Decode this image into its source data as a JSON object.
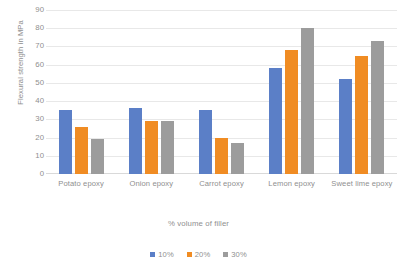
{
  "chart_data": {
    "type": "bar",
    "title": "",
    "subtitle": "",
    "xlabel": "% volume of filler",
    "ylabel": "Flexural strength in MPa",
    "categories": [
      "Potato epoxy",
      "Onion epoxy",
      "Carrot epoxy",
      "Lemon epoxy",
      "Sweet lime epoxy"
    ],
    "series": [
      {
        "name": "10%",
        "color": "#5b7fc7",
        "values": [
          35,
          36,
          35,
          58,
          52
        ]
      },
      {
        "name": "20%",
        "color": "#f08c23",
        "values": [
          26,
          29,
          20,
          68,
          65
        ]
      },
      {
        "name": "30%",
        "color": "#9c9c9c",
        "values": [
          19,
          29,
          17,
          80,
          73
        ]
      }
    ],
    "ylim": [
      0,
      90
    ],
    "ytick_step": 10,
    "yticks": [
      "90",
      "80",
      "70",
      "60",
      "50",
      "40",
      "30",
      "20",
      "10",
      "0"
    ],
    "grid": true,
    "grid_axis": "y",
    "legend_position": "bottom"
  },
  "legend": {
    "items": [
      {
        "label": "10%",
        "color": "#5b7fc7"
      },
      {
        "label": "20%",
        "color": "#f08c23"
      },
      {
        "label": "30%",
        "color": "#9c9c9c"
      }
    ]
  }
}
